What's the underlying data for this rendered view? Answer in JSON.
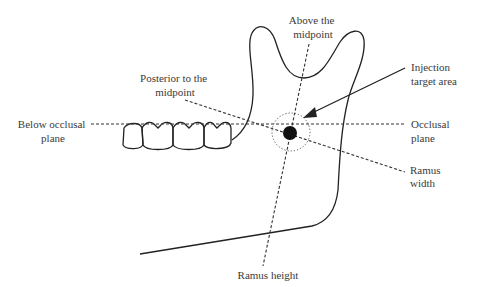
{
  "diagram": {
    "type": "anatomical-schematic",
    "labels": {
      "above_midpoint": [
        "Above the",
        "midpoint"
      ],
      "posterior_midpoint": [
        "Posterior to the",
        "midpoint"
      ],
      "injection_target": [
        "Injection",
        "target area"
      ],
      "below_occlusal": [
        "Below occlusal",
        "plane"
      ],
      "occlusal_plane": [
        "Occlusal",
        "plane"
      ],
      "ramus_width": [
        "Ramus",
        "width"
      ],
      "ramus_height": "Ramus height"
    },
    "elements": {
      "teeth_count": 4,
      "target_marker": "filled-circle-in-dotted-circle",
      "arrow": "pointer-to-target"
    },
    "colors": {
      "line": "#222222",
      "text": "#3a3a3a",
      "background": "#ffffff"
    }
  }
}
